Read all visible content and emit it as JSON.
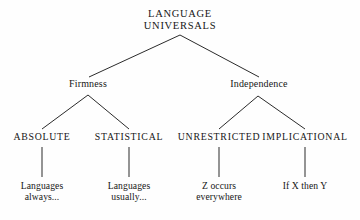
{
  "diagram": {
    "background_color": "#fefefe",
    "line_color": "#2b2b2b",
    "text_color": "#161616",
    "root": {
      "line1": "LANGUAGE",
      "line2": "UNIVERSALS"
    },
    "branches": [
      {
        "label": "Firmness"
      },
      {
        "label": "Independence"
      }
    ],
    "categories": [
      {
        "label": "ABSOLUTE"
      },
      {
        "label": "STATISTICAL"
      },
      {
        "label": "UNRESTRICTED"
      },
      {
        "label": "IMPLICATIONAL"
      }
    ],
    "leaves": [
      {
        "line1": "Languages",
        "line2": "always..."
      },
      {
        "line1": "Languages",
        "line2": "usually..."
      },
      {
        "line1": "Z occurs",
        "line2": "everywhere"
      },
      {
        "line1": "If X then Y",
        "line2": ""
      }
    ]
  }
}
